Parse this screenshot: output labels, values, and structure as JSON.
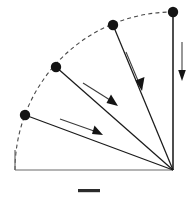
{
  "figure": {
    "background_color": "#ffffff",
    "line_color": "#1a1a1a",
    "arc_color": "#4a4a4a",
    "frame_color": "#6b6b6b",
    "dot_color": "#141414",
    "scale_bar_color": "#2b2b2b",
    "caption": ""
  },
  "chart_data": {
    "type": "scatter",
    "title": "",
    "subtitle": "",
    "xlabel": "",
    "ylabel": "",
    "xlim": [
      0,
      194
    ],
    "ylim": [
      0,
      197
    ],
    "grid": false,
    "legend": "none",
    "annotations": [
      "dashed quarter-circle arc",
      "four radial lines from pivot to arc nodes",
      "motion arrows indicating clockwise sweep",
      "vertical downward arrow at right",
      "horizontal scale bar below figure"
    ],
    "origin": {
      "name": "pivot",
      "x": 173,
      "y": 170
    },
    "radius": 158,
    "arc": {
      "start_angle_deg": 180,
      "end_angle_deg": 90,
      "dash_pattern": "4 3.2"
    },
    "categories": [
      "node-1",
      "node-2",
      "node-3",
      "node-4"
    ],
    "series": [
      {
        "name": "arc nodes",
        "points": [
          {
            "label": "node-1",
            "x": 173,
            "y": 12,
            "angle_deg": 90,
            "dot_radius": 5.2
          },
          {
            "label": "node-2",
            "x": 113,
            "y": 25,
            "angle_deg": 111,
            "dot_radius": 5.2
          },
          {
            "label": "node-3",
            "x": 56,
            "y": 67,
            "angle_deg": 143,
            "dot_radius": 5.2
          },
          {
            "label": "node-4",
            "x": 25,
            "y": 115,
            "angle_deg": 162,
            "dot_radius": 5.2
          }
        ]
      }
    ],
    "radial_lines": [
      {
        "name": "radius-1",
        "x1": 173,
        "y1": 170,
        "x2": 173,
        "y2": 12
      },
      {
        "name": "radius-2",
        "x1": 173,
        "y1": 170,
        "x2": 113,
        "y2": 25
      },
      {
        "name": "radius-3",
        "x1": 173,
        "y1": 170,
        "x2": 56,
        "y2": 67
      },
      {
        "name": "radius-4",
        "x1": 173,
        "y1": 170,
        "x2": 25,
        "y2": 115
      }
    ],
    "frame_lines": [
      {
        "name": "baseline",
        "x1": 15,
        "y1": 170,
        "x2": 173,
        "y2": 170
      },
      {
        "name": "vertical-axis",
        "x1": 173,
        "y1": 170,
        "x2": 173,
        "y2": 12
      },
      {
        "name": "left-edge",
        "x1": 15,
        "y1": 170,
        "x2": 15,
        "y2": 150
      }
    ],
    "motion_arrows": [
      {
        "name": "sweep-arrow-1",
        "x1": 126,
        "y1": 52,
        "x2": 141,
        "y2": 88,
        "direction": "down-right"
      },
      {
        "name": "sweep-arrow-2",
        "x1": 83,
        "y1": 83,
        "x2": 114,
        "y2": 103,
        "direction": "down-right"
      },
      {
        "name": "sweep-arrow-3",
        "x1": 60,
        "y1": 119,
        "x2": 98,
        "y2": 133,
        "direction": "down-right"
      },
      {
        "name": "descent-arrow",
        "x1": 182,
        "y1": 42,
        "x2": 182,
        "y2": 80,
        "direction": "down"
      }
    ],
    "scale_bar": {
      "x": 78,
      "y": 189,
      "width": 22,
      "height": 3.2,
      "label": ""
    }
  }
}
